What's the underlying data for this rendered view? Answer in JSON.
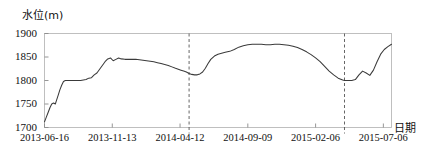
{
  "chart_data": {
    "type": "line",
    "title": "",
    "ylabel": "水位(m)",
    "xlabel": "日期",
    "ylim": [
      1700,
      1900
    ],
    "yticks": [
      1700,
      1750,
      1800,
      1850,
      1900
    ],
    "ytick_labels": [
      "1700",
      "1750",
      "1800",
      "1850",
      "1900"
    ],
    "xtick_labels": [
      "2013-06-16",
      "2013-11-13",
      "2014-04-12",
      "2014-09-09",
      "2015-02-06",
      "2015-07-06"
    ],
    "xtick_positions": [
      0,
      150,
      300,
      450,
      600,
      750
    ],
    "xlim": [
      0,
      768
    ],
    "grid": false,
    "legend": false,
    "annotations": [
      {
        "name": "divider-1",
        "type": "vertical-dashed-line",
        "x": 320
      },
      {
        "name": "divider-2",
        "type": "vertical-dashed-line",
        "x": 664
      }
    ],
    "series": [
      {
        "name": "水位",
        "color": "#3a3a3a",
        "x": [
          0,
          4,
          8,
          12,
          16,
          20,
          24,
          26,
          30,
          34,
          38,
          42,
          46,
          50,
          56,
          62,
          68,
          74,
          80,
          86,
          92,
          98,
          104,
          110,
          116,
          122,
          128,
          134,
          140,
          146,
          152,
          158,
          164,
          170,
          178,
          186,
          194,
          202,
          210,
          218,
          226,
          234,
          242,
          250,
          258,
          266,
          274,
          282,
          290,
          296,
          302,
          308,
          314,
          320,
          326,
          332,
          338,
          344,
          350,
          356,
          362,
          368,
          376,
          384,
          392,
          400,
          410,
          420,
          430,
          440,
          450,
          460,
          470,
          480,
          490,
          500,
          510,
          520,
          530,
          540,
          550,
          560,
          570,
          580,
          590,
          600,
          610,
          620,
          630,
          640,
          650,
          660,
          664,
          672,
          680,
          688,
          696,
          704,
          712,
          720,
          728,
          736,
          744,
          752,
          760,
          768
        ],
        "y": [
          1712,
          1722,
          1732,
          1742,
          1750,
          1752,
          1750,
          1756,
          1768,
          1780,
          1790,
          1798,
          1800,
          1800,
          1800,
          1800,
          1800,
          1800,
          1800,
          1801,
          1802,
          1805,
          1806,
          1812,
          1816,
          1824,
          1832,
          1840,
          1846,
          1848,
          1842,
          1845,
          1848,
          1846,
          1845,
          1845,
          1845,
          1845,
          1844,
          1843,
          1842,
          1841,
          1840,
          1838,
          1836,
          1834,
          1832,
          1829,
          1826,
          1824,
          1822,
          1820,
          1818,
          1815,
          1813,
          1812,
          1812,
          1814,
          1818,
          1826,
          1836,
          1845,
          1852,
          1856,
          1858,
          1860,
          1862,
          1866,
          1871,
          1874,
          1876,
          1877,
          1877,
          1877,
          1876,
          1876,
          1877,
          1877,
          1876,
          1875,
          1873,
          1870,
          1866,
          1861,
          1855,
          1848,
          1840,
          1830,
          1820,
          1812,
          1805,
          1801,
          1800,
          1800,
          1800,
          1802,
          1812,
          1820,
          1816,
          1811,
          1822,
          1840,
          1856,
          1866,
          1872,
          1877
        ]
      }
    ]
  }
}
